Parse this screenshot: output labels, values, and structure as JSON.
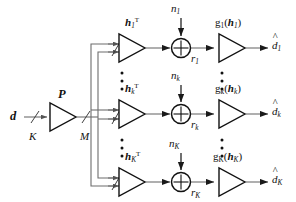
{
  "figure": {
    "type": "block-diagram",
    "background": "#ffffff",
    "line_color": "#3f3f3f",
    "ink_color": "#111111"
  },
  "input": {
    "signal_label": "d",
    "dimension_label": "K",
    "precoder_label": "P",
    "precoder_out_dimension_label": "M"
  },
  "branches": [
    {
      "id": "branch-1",
      "channel_label": "h",
      "channel_sub": "1",
      "channel_sup": "T",
      "noise_label": "n",
      "noise_sub": "1",
      "received_label": "r",
      "received_sub": "1",
      "detector_label": "g",
      "detector_sub": "1",
      "detector_arg": "h",
      "detector_arg_sub": "1",
      "output_label": "d",
      "output_sub": "1",
      "output_hat": "^"
    },
    {
      "id": "branch-k",
      "channel_label": "h",
      "channel_sub": "k",
      "channel_sup": "T",
      "noise_label": "n",
      "noise_sub": "k",
      "received_label": "r",
      "received_sub": "k",
      "detector_label": "g",
      "detector_sub": "k",
      "detector_arg": "h",
      "detector_arg_sub": "k",
      "output_label": "d",
      "output_sub": "k",
      "output_hat": "^"
    },
    {
      "id": "branch-K",
      "channel_label": "h",
      "channel_sub": "K",
      "channel_sup": "T",
      "noise_label": "n",
      "noise_sub": "K",
      "received_label": "r",
      "received_sub": "K",
      "detector_label": "g",
      "detector_sub": "K",
      "detector_arg": "h",
      "detector_arg_sub": "K",
      "output_label": "d",
      "output_sub": "K",
      "output_hat": "^"
    }
  ],
  "ellipses": {
    "glyph": "•",
    "count": 3,
    "note": "vertical ellipsis between branch rows"
  },
  "symbols": {
    "summer": "⊕",
    "paren_open": "(",
    "paren_close": ")"
  }
}
